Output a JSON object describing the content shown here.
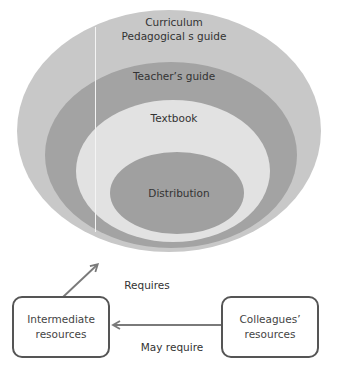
{
  "colors": {
    "outer_ellipse": "#c8c8c8",
    "teachers_guide_ellipse": "#a3a3a3",
    "textbook_ellipse": "#e2e2e2",
    "distribution_ellipse": "#a0a0a0",
    "box_border": "#555555",
    "arrow": "#7a7a7a",
    "text": "#333333"
  },
  "layers": [
    {
      "id": "curriculum",
      "lines": [
        "Curriculum",
        "Pedagogical s guide"
      ]
    },
    {
      "id": "teachers-guide",
      "lines": [
        "Teacher’s guide"
      ]
    },
    {
      "id": "textbook",
      "lines": [
        "Textbook"
      ]
    },
    {
      "id": "distribution",
      "lines": [
        "Distribution"
      ]
    }
  ],
  "boxes": {
    "intermediate": {
      "lines": [
        "Intermediate",
        "resources"
      ]
    },
    "colleagues": {
      "lines": [
        "Colleagues’",
        "resources"
      ]
    }
  },
  "arrows": {
    "requires": {
      "label": "Requires"
    },
    "may_require": {
      "label": "May require"
    }
  }
}
